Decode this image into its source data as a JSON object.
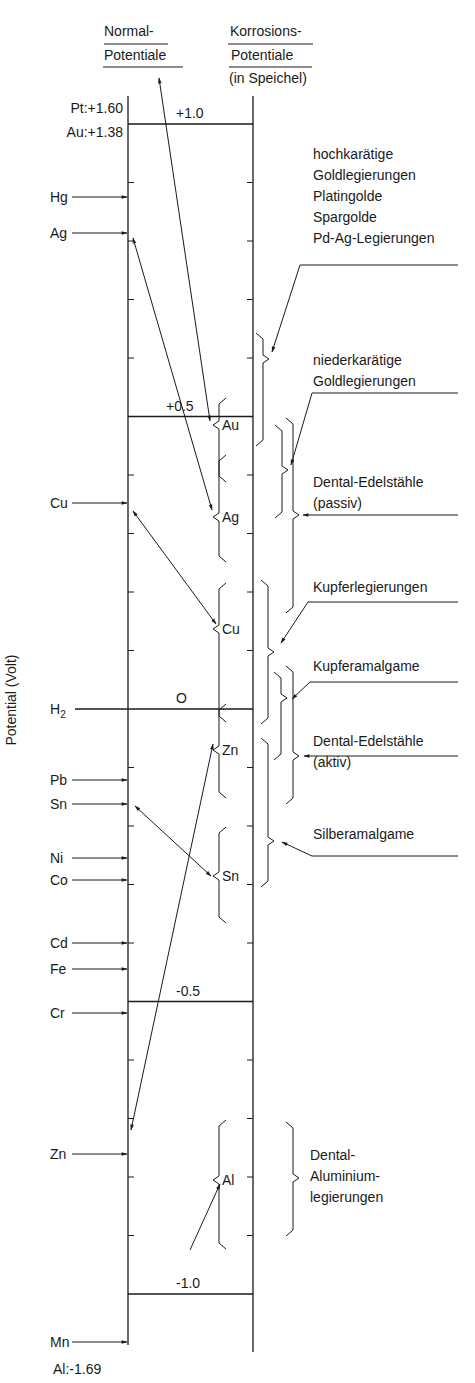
{
  "headers": {
    "normal": {
      "line1": "Normal-",
      "line2": "Potentiale"
    },
    "korrosion": {
      "line1": "Korrosions-",
      "line2": "Potentiale",
      "line3": "(in Speichel)"
    }
  },
  "axis": {
    "label": "Potential (Volt)",
    "top_labels": [
      {
        "text": "Pt:+1.60",
        "y": 109
      },
      {
        "text": "Au:+1.38",
        "y": 133
      }
    ],
    "bottom_labels": [
      {
        "text": "Al:-1.69",
        "y": 1370
      }
    ],
    "scale_lines": [
      {
        "value": 1.0,
        "label": "+1.0"
      },
      {
        "value": 0.5,
        "label": "+0.5"
      },
      {
        "value": 0.0,
        "label": "O"
      },
      {
        "value": -0.5,
        "label": "-0.5"
      },
      {
        "value": -1.0,
        "label": "-1.0"
      }
    ],
    "y_at_plus1": 124,
    "px_per_volt": 585,
    "left_x": 128,
    "right_x": 253,
    "top_y": 96,
    "bottom_y_left": 1345,
    "bottom_y_right": 1352
  },
  "normal_potentials": [
    {
      "element": "Hg",
      "y": 197
    },
    {
      "element": "Ag",
      "y": 233
    },
    {
      "element": "Cu",
      "y": 503
    },
    {
      "element": "H2",
      "y": 709
    },
    {
      "element": "Pb",
      "y": 780
    },
    {
      "element": "Sn",
      "y": 804
    },
    {
      "element": "Ni",
      "y": 858
    },
    {
      "element": "Co",
      "y": 880
    },
    {
      "element": "Cd",
      "y": 943
    },
    {
      "element": "Fe",
      "y": 969
    },
    {
      "element": "Cr",
      "y": 1013
    },
    {
      "element": "Zn",
      "y": 1154
    },
    {
      "element": "Mn",
      "y": 1342
    }
  ],
  "corrosion_metals": [
    {
      "element": "Au",
      "top": 398,
      "mid": 425,
      "bottom": 482
    },
    {
      "element": "Ag",
      "top": 455,
      "mid": 517,
      "bottom": 562
    },
    {
      "element": "Cu",
      "top": 583,
      "mid": 629,
      "bottom": 722
    },
    {
      "element": "Zn",
      "top": 704,
      "mid": 750,
      "bottom": 798
    },
    {
      "element": "Sn",
      "top": 827,
      "mid": 876,
      "bottom": 923
    },
    {
      "element": "Al",
      "top": 1120,
      "mid": 1180,
      "bottom": 1249
    }
  ],
  "alloy_groups": [
    {
      "label_lines": [
        "hochkarätige",
        "Goldlegierungen",
        "Platingolde",
        "Spargolde",
        "Pd-Ag-Legierungen"
      ],
      "text_y": 159,
      "bracket": {
        "x": 263,
        "top": 333,
        "mid": 359,
        "bottom": 446
      },
      "leader_y": 265
    },
    {
      "label_lines": [
        "niederkarätige",
        "Goldlegierungen"
      ],
      "text_y": 365,
      "bracket": {
        "x": 282,
        "top": 425,
        "mid": 470,
        "bottom": 518
      },
      "leader_y": 393
    },
    {
      "label_lines": [
        "Dental-Edelstähle",
        "(passiv)"
      ],
      "text_y": 487,
      "bracket": {
        "x": 293,
        "top": 418,
        "mid": 515,
        "bottom": 613
      },
      "leader_y": 515
    },
    {
      "label_lines": [
        "Kupferlegierungen"
      ],
      "text_y": 592,
      "bracket": {
        "x": 268,
        "top": 580,
        "mid": 652,
        "bottom": 724
      },
      "leader_y": 602
    },
    {
      "label_lines": [
        "Kupferamalgame"
      ],
      "text_y": 671,
      "bracket": {
        "x": 281,
        "top": 672,
        "mid": 698,
        "bottom": 760
      },
      "leader_y": 682
    },
    {
      "label_lines": [
        "Dental-Edelstähle",
        "(aktiv)"
      ],
      "text_y": 746,
      "bracket": {
        "x": 293,
        "top": 666,
        "mid": 756,
        "bottom": 804
      },
      "leader_y": 756
    },
    {
      "label_lines": [
        "Silberamalgame"
      ],
      "text_y": 839,
      "bracket": {
        "x": 268,
        "top": 738,
        "mid": 841,
        "bottom": 887
      },
      "leader_y": 856
    },
    {
      "label_lines": [
        "Dental-",
        "Aluminium-",
        "legierungen"
      ],
      "text_y": 1160,
      "bracket": {
        "x": 293,
        "top": 1122,
        "mid": 1178,
        "bottom": 1236
      },
      "leader_y": null
    }
  ],
  "connections": [
    {
      "from": "Au:+1.38 (top arrow)",
      "to": "Au corrosion"
    },
    {
      "from": "Ag normal",
      "to": "Ag corrosion"
    },
    {
      "from": "Cu normal",
      "to": "Cu corrosion"
    },
    {
      "from": "Sn normal",
      "to": "Sn corrosion"
    },
    {
      "from": "Zn normal",
      "to": "Zn corrosion"
    },
    {
      "from": "Al:-1.69",
      "to": "Al corrosion"
    }
  ]
}
